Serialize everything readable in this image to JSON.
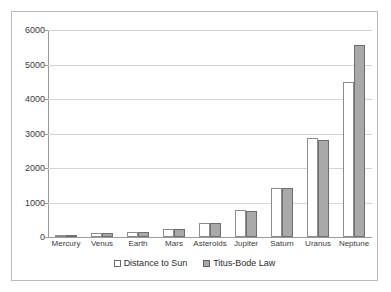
{
  "chart_data": {
    "type": "bar",
    "title": "",
    "subtitle": "",
    "xlabel": "",
    "ylabel": "",
    "categories": [
      "Mercury",
      "Venus",
      "Earth",
      "Mars",
      "Asteroids",
      "Jupiter",
      "Saturn",
      "Uranus",
      "Neptune"
    ],
    "series": [
      {
        "name": "Distance to Sun",
        "color": "#ffffff",
        "border_color": "#8c8c8c",
        "values": [
          58,
          108,
          150,
          228,
          414,
          778,
          1430,
          2880,
          4500
        ]
      },
      {
        "name": "Titus-Bode Law",
        "color": "#a9a9a9",
        "border_color": "#6e6e6e",
        "values": [
          56,
          103,
          149,
          228,
          414,
          749,
          1435,
          2808,
          5554
        ]
      }
    ],
    "ylim": [
      0,
      6000
    ],
    "yticks": [
      0,
      1000,
      2000,
      3000,
      4000,
      5000,
      6000
    ],
    "ytick_labels": [
      "0",
      "1000",
      "2000",
      "3000",
      "4000",
      "5000",
      "6000"
    ],
    "grid": true,
    "legend_position": "bottom",
    "legend_entries": [
      "Distance to Sun",
      "Titus-Bode Law"
    ]
  }
}
